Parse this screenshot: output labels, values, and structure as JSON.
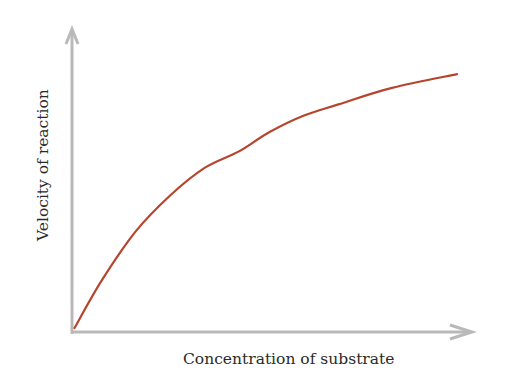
{
  "chart_data": {
    "type": "line",
    "title": "",
    "xlabel": "Concentration of substrate",
    "ylabel": "Velocity of reaction",
    "grid": false,
    "legend": null,
    "ticks": false,
    "series": [
      {
        "name": "Reaction velocity",
        "color": "#b5452e",
        "description": "Saturating (Michaelis-Menten-like) hyperbolic curve rising from the origin and levelling off",
        "x": [
          0,
          0.07,
          0.16,
          0.25,
          0.34,
          0.43,
          0.51,
          0.6,
          0.69,
          0.83,
          1.0
        ],
        "y": [
          0,
          0.17,
          0.35,
          0.48,
          0.58,
          0.64,
          0.71,
          0.77,
          0.81,
          0.87,
          0.92
        ]
      }
    ],
    "xlim": [
      0,
      1
    ],
    "ylim": [
      0,
      1
    ]
  },
  "colors": {
    "axis": "#b9b9b9",
    "curve": "#b5452e",
    "text": "#2a2a2a"
  }
}
